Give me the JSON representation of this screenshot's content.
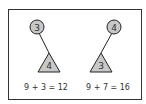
{
  "diagram": {
    "panels": [
      {
        "circle_label": "3",
        "triangle_label": "4",
        "equation": "9 + 3 = 12"
      },
      {
        "circle_label": "4",
        "triangle_label": "3",
        "equation": "9 + 7 = 16"
      }
    ],
    "colors": {
      "node_fill": "#c8c8c8",
      "stroke": "#222222",
      "text": "#333333"
    }
  }
}
